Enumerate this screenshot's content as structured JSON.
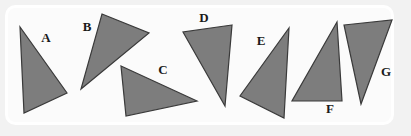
{
  "figure": {
    "title": "",
    "canvas": {
      "width": 411,
      "height": 136
    },
    "background_color": "#f2f2f2",
    "panel": {
      "x": 6.5,
      "y": 6.5,
      "width": 386,
      "height": 117,
      "rx": 9,
      "fill": "#fbfbfb",
      "stroke": "#ffffff",
      "stroke_width": 3
    },
    "style": {
      "shape_fill": "#7d7d7d",
      "shape_stroke": "#3a3a3a",
      "shape_stroke_width": 1.2,
      "label_color": "#1a1a1a",
      "label_font_size": 13
    }
  },
  "shapes": [
    {
      "label": "A",
      "type": "triangle",
      "points": "20,27 24,113 67,93",
      "label_pos": {
        "x": 46,
        "y": 39
      }
    },
    {
      "label": "B",
      "type": "triangle",
      "points": "102,14 149,33 81,89",
      "label_pos": {
        "x": 87,
        "y": 28
      }
    },
    {
      "label": "C",
      "type": "triangle",
      "points": "121,66 197,101 126,116",
      "label_pos": {
        "x": 163,
        "y": 71
      }
    },
    {
      "label": "D",
      "type": "triangle",
      "points": "232,25 183,32 225,106",
      "label_pos": {
        "x": 204,
        "y": 19
      }
    },
    {
      "label": "E",
      "type": "triangle",
      "points": "289,28 284,118 240,96",
      "label_pos": {
        "x": 261,
        "y": 42
      }
    },
    {
      "label": "F",
      "type": "triangle",
      "points": "337,22 342,101 292,101",
      "label_pos": {
        "x": 330,
        "y": 110
      }
    },
    {
      "label": "G",
      "type": "triangle",
      "points": "344,25 392,20 361,104",
      "label_pos": {
        "x": 386,
        "y": 73
      }
    }
  ],
  "shape_count": 7
}
